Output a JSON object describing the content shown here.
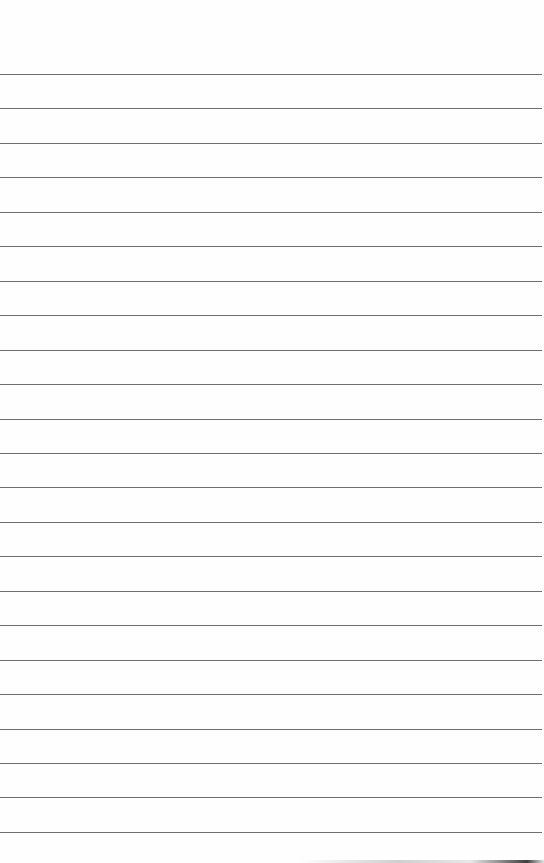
{
  "image": {
    "subject": "blank lined notepaper",
    "paper_color": "#fefefe",
    "line_color": "#6e6e6e",
    "line_count": 23,
    "first_line_y": 74,
    "line_spacing_px": 34.45
  }
}
